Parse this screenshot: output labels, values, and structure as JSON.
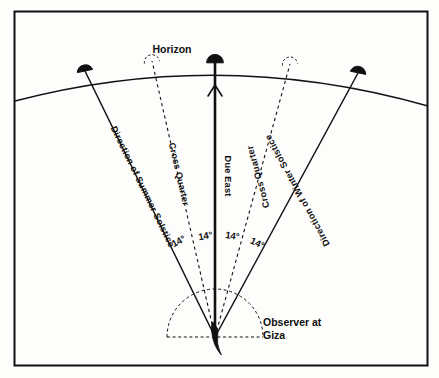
{
  "figure": {
    "kind": "astronomy-horizon-diagram",
    "frame_color": "#111111",
    "line_color": "#111111",
    "sun_color": "#111111",
    "background": "#fdfdfb"
  },
  "labels": {
    "horizon": "Horizon",
    "due_east": "Due East",
    "cross_quarter_left": "Cross Quarter",
    "cross_quarter_right": "Cross Quarter",
    "summer_solstice": "Direction of Summer Solstice",
    "winter_solstice": "Direction of Winter Solstice",
    "observer_line1": "Observer at",
    "observer_line2": "Giza"
  },
  "angles": {
    "a1": "14°",
    "a2": "14°",
    "a3": "14°",
    "a4": "14°"
  },
  "markers": {
    "sun_summer": "filled-sun-disc",
    "sun_due_east": "filled-sun-disc",
    "sun_winter": "filled-sun-disc",
    "cross_quarter_left_marker": "open-sun-disc",
    "cross_quarter_right_marker": "open-sun-disc",
    "observer": "observer-figure",
    "due_east_arrow": "up-arrow"
  }
}
